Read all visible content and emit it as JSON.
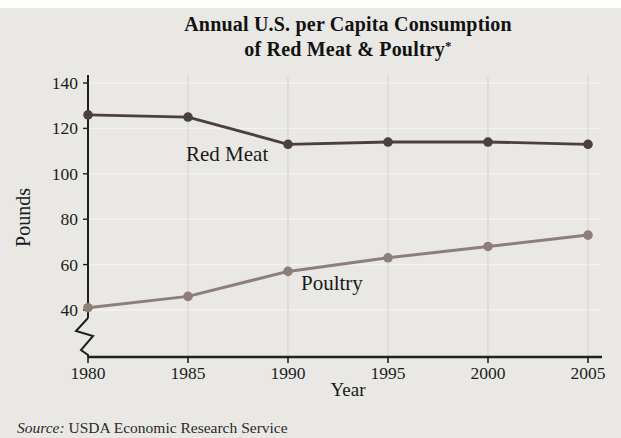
{
  "figure": {
    "title_line1": "Annual U.S. per Capita Consumption",
    "title_line2": "of Red Meat & Poultry",
    "title_footnote_marker": "*",
    "source_label": "Source:",
    "source_text": "USDA Economic Research Service",
    "background_color": "#e9e8e4",
    "axis_color": "#1f1f1f"
  },
  "chart_data": {
    "type": "line",
    "title": "Annual U.S. per Capita Consumption of Red Meat & Poultry*",
    "xlabel": "Year",
    "ylabel": "Pounds",
    "x": [
      1980,
      1985,
      1990,
      1995,
      2000,
      2005
    ],
    "series": [
      {
        "name": "Red Meat",
        "values": [
          126,
          125,
          113,
          114,
          114,
          113
        ],
        "color": "#4c403d"
      },
      {
        "name": "Poultry",
        "values": [
          41,
          46,
          57,
          63,
          68,
          73
        ],
        "color": "#8d7e79"
      }
    ],
    "y_ticks": [
      40,
      60,
      80,
      100,
      120,
      140
    ],
    "ylim": [
      40,
      140
    ],
    "xlim": [
      1980,
      2005
    ],
    "axis_break_below": 40,
    "grid": true,
    "legend_position": "inline-labels",
    "grid_color_vertical": "#d8d7d1",
    "grid_color_horizontal": "#f4f3ee",
    "tick_label_color": "#1c1c1c"
  }
}
